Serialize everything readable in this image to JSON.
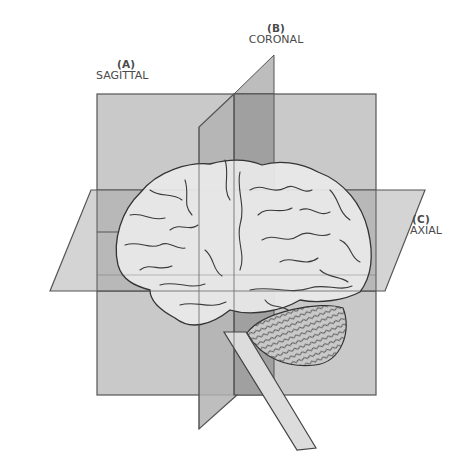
{
  "diagram": {
    "planes": [
      {
        "id": "sagittal",
        "code": "(A)",
        "name": "SAGITTAL"
      },
      {
        "id": "coronal",
        "code": "(B)",
        "name": "CORONAL"
      },
      {
        "id": "axial",
        "code": "(C)",
        "name": "AXIAL"
      }
    ],
    "parts": [
      "cerebrum",
      "cerebellum",
      "brainstem"
    ],
    "colors": {
      "background": "#ffffff",
      "sagittal_fill": "#c9c9c9",
      "coronal_fill": "#b3b3b3",
      "coronal_overlap_fill": "#9e9e9e",
      "axial_fill": "#d4d4d4",
      "axial_overlap_fill": "#b6b6b6",
      "brain_fill": "#e9e9e9",
      "outline": "#444444",
      "label_text": "#4a4a4a"
    }
  }
}
